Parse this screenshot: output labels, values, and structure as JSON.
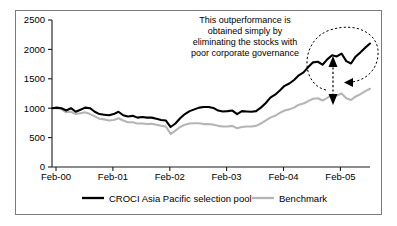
{
  "figure": {
    "border_color": "#7a7a7a",
    "background": "#ffffff"
  },
  "annotation": {
    "lines": [
      "This outperformance is",
      "obtained simply by",
      "eliminating the stocks with",
      "poor corporate governance"
    ],
    "full_text": "This outperformance is obtained simply by eliminating the stocks with poor corporate governance"
  },
  "legend": {
    "entries": [
      {
        "label": "CROCI Asia Pacific selection pool",
        "color": "#000000"
      },
      {
        "label": "Benchmark",
        "color": "#b5b5b5"
      }
    ]
  },
  "chart_data": {
    "type": "line",
    "title": "",
    "subtitle": "",
    "xlabel": "",
    "ylabel": "",
    "grid": false,
    "legend_position": "bottom",
    "ylim": [
      0,
      2500
    ],
    "ytick_labels": [
      "0",
      "500",
      "1000",
      "1500",
      "2000",
      "2500"
    ],
    "yticks": [
      0,
      500,
      1000,
      1500,
      2000,
      2500
    ],
    "xtick_labels": [
      "Feb-00",
      "Feb-01",
      "Feb-02",
      "Feb-03",
      "Feb-04",
      "Feb-05"
    ],
    "xticks": [
      0,
      12,
      24,
      36,
      48,
      60
    ],
    "xlim": [
      0,
      67
    ],
    "x": [
      0,
      1,
      2,
      3,
      4,
      5,
      6,
      7,
      8,
      9,
      10,
      11,
      12,
      13,
      14,
      15,
      16,
      17,
      18,
      19,
      20,
      21,
      22,
      23,
      24,
      25,
      26,
      27,
      28,
      29,
      30,
      31,
      32,
      33,
      34,
      35,
      36,
      37,
      38,
      39,
      40,
      41,
      42,
      43,
      44,
      45,
      46,
      47,
      48,
      49,
      50,
      51,
      52,
      53,
      54,
      55,
      56,
      57,
      58,
      59,
      60,
      61,
      62,
      63,
      64,
      65,
      66,
      67
    ],
    "series": [
      {
        "name": "CROCI Asia Pacific selection pool",
        "color": "#000000",
        "values": [
          1000,
          1010,
          1000,
          960,
          1000,
          940,
          975,
          1010,
          1000,
          940,
          900,
          890,
          880,
          900,
          940,
          880,
          860,
          870,
          840,
          850,
          840,
          840,
          820,
          800,
          790,
          680,
          740,
          830,
          900,
          950,
          980,
          1010,
          1020,
          1020,
          1005,
          960,
          945,
          950,
          960,
          900,
          950,
          945,
          940,
          950,
          1010,
          1085,
          1180,
          1230,
          1300,
          1380,
          1420,
          1480,
          1560,
          1610,
          1700,
          1780,
          1790,
          1740,
          1830,
          1900,
          1880,
          1930,
          1800,
          1760,
          1880,
          1950,
          2030,
          2100
        ]
      },
      {
        "name": "Benchmark",
        "color": "#b5b5b5",
        "values": [
          1000,
          1000,
          985,
          930,
          940,
          900,
          915,
          930,
          900,
          860,
          820,
          810,
          790,
          800,
          830,
          790,
          760,
          760,
          740,
          740,
          730,
          735,
          720,
          700,
          690,
          560,
          620,
          680,
          720,
          740,
          745,
          745,
          730,
          730,
          720,
          700,
          690,
          690,
          700,
          660,
          680,
          690,
          690,
          700,
          740,
          790,
          840,
          870,
          920,
          960,
          980,
          1010,
          1060,
          1080,
          1120,
          1160,
          1170,
          1130,
          1175,
          1230,
          1215,
          1250,
          1170,
          1140,
          1200,
          1240,
          1290,
          1330
        ]
      }
    ]
  }
}
